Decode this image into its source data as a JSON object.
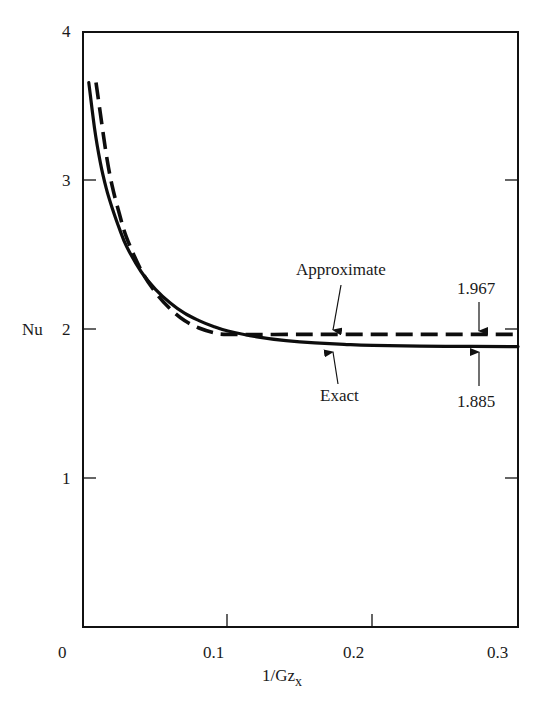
{
  "chart_data": {
    "type": "line",
    "title": "",
    "xlabel": "1/Gz",
    "xlabel_subscript": "x",
    "ylabel": "Nu",
    "xlim": [
      0,
      0.3
    ],
    "ylim": [
      0,
      4
    ],
    "grid": false,
    "legend": "none (inline annotations)",
    "x_ticks": [
      "0",
      "0.1",
      "0.2",
      "0.3"
    ],
    "y_ticks": [
      "1",
      "2",
      "3",
      "4"
    ],
    "series": [
      {
        "name": "Exact",
        "style": "solid",
        "x": [
          0.004,
          0.008,
          0.012,
          0.016,
          0.02,
          0.025,
          0.03,
          0.04,
          0.05,
          0.06,
          0.07,
          0.08,
          0.09,
          0.1,
          0.12,
          0.14,
          0.16,
          0.18,
          0.2,
          0.25,
          0.3
        ],
        "y": [
          3.66,
          3.35,
          3.12,
          2.95,
          2.82,
          2.68,
          2.56,
          2.39,
          2.27,
          2.18,
          2.11,
          2.06,
          2.02,
          1.99,
          1.95,
          1.925,
          1.91,
          1.9,
          1.893,
          1.887,
          1.885
        ]
      },
      {
        "name": "Approximate",
        "style": "dashed",
        "x": [
          0.009,
          0.012,
          0.016,
          0.02,
          0.025,
          0.03,
          0.04,
          0.05,
          0.06,
          0.07,
          0.08,
          0.09,
          0.1,
          0.15,
          0.2,
          0.25,
          0.3
        ],
        "y": [
          3.66,
          3.45,
          3.18,
          2.97,
          2.78,
          2.62,
          2.4,
          2.25,
          2.14,
          2.06,
          2.01,
          1.98,
          1.967,
          1.967,
          1.967,
          1.967,
          1.967
        ]
      }
    ],
    "annotations": [
      {
        "text": "Approximate",
        "arrow_to": [
          0.17,
          1.967
        ]
      },
      {
        "text": "Exact",
        "arrow_to": [
          0.17,
          1.885
        ]
      },
      {
        "text": "1.967",
        "arrow_to": [
          0.27,
          1.967
        ]
      },
      {
        "text": "1.885",
        "arrow_to": [
          0.27,
          1.885
        ]
      }
    ]
  },
  "labels": {
    "y_axis": "Nu",
    "x_axis_main": "1/Gz",
    "x_axis_sub": "x",
    "x_ticks": [
      "0",
      "0.1",
      "0.2",
      "0.3"
    ],
    "y_ticks": [
      "1",
      "2",
      "3",
      "4"
    ],
    "approximate": "Approximate",
    "exact": "Exact",
    "val_approx": "1.967",
    "val_exact": "1.885"
  }
}
